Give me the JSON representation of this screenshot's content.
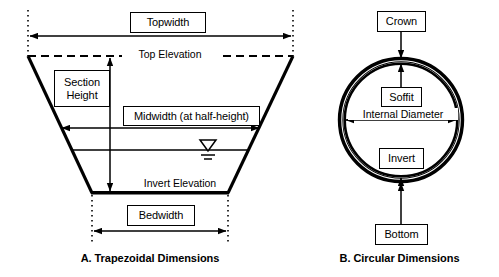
{
  "figure": {
    "title_a": "A. Trapezoidal Dimensions",
    "title_b": "B. Circular Dimensions"
  },
  "trapezoid": {
    "topwidth_label": "Topwidth",
    "top_elevation_label": "Top Elevation",
    "section_height_line1": "Section",
    "section_height_line2": "Height",
    "midwidth_label": "Midwidth (at half-height)",
    "invert_elevation_label": "Invert Elevation",
    "bedwidth_label": "Bedwidth",
    "water_surface_icon": "water-surface-symbol"
  },
  "circular": {
    "crown_label": "Crown",
    "soffit_label": "Soffit",
    "internal_diameter_label": "Internal Diameter",
    "invert_label": "Invert",
    "bottom_label": "Bottom"
  },
  "colors": {
    "line": "#000000",
    "background": "#ffffff"
  }
}
